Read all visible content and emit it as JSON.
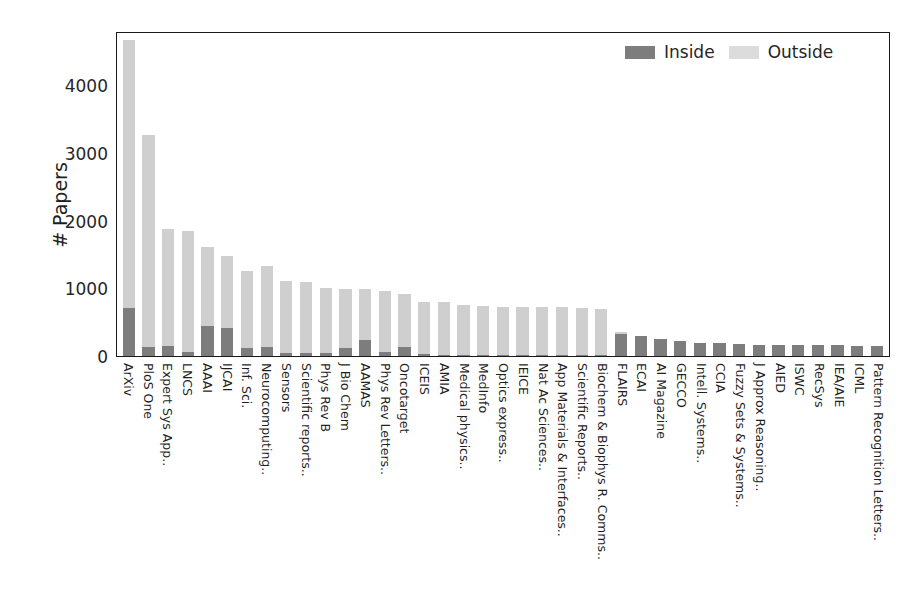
{
  "chart_data": {
    "type": "bar",
    "stacked": true,
    "title": "",
    "xlabel": "",
    "ylabel": "# Papers",
    "ylim": [
      0,
      4800
    ],
    "yticks": [
      0,
      1000,
      2000,
      3000,
      4000
    ],
    "ytick_labels": [
      "0",
      "1000",
      "2000",
      "3000",
      "4000"
    ],
    "grid": false,
    "legend_position": "upper right",
    "categories": [
      "ArXiv",
      "PloS One",
      "Expert Sys App..",
      "LNCS",
      "AAAI",
      "IJCAI",
      "Inf. Sci.",
      "Neurocomputing..",
      "Sensors",
      "Scientific reports..",
      "Phys Rev B",
      "J Bio Chem",
      "AAMAS",
      "Phys Rev Letters..",
      "Oncotarget",
      "ICEIS",
      "AMIA",
      "Medical physics..",
      "MedInfo",
      "Optics express..",
      "IEICE",
      "Nat Ac Sciences..",
      "App Materials & Interfaces..",
      "Scientific Reports..",
      "Biochem & Biophys R. Comms..",
      "FLAIRS",
      "ECAI",
      "AI Magazine",
      "GECCO",
      "Intell. Systems..",
      "CCIA",
      "Fuzzy Sets & Systems..",
      "J Approx Reasoning..",
      "AIED",
      "ISWC",
      "RecSys",
      "IEA/AIE",
      "ICML",
      "Pattern Recognition Letters.."
    ],
    "series": [
      {
        "name": "Inside",
        "color": "#7d7d7d",
        "values": [
          710,
          130,
          150,
          60,
          440,
          410,
          120,
          140,
          40,
          50,
          40,
          120,
          230,
          60,
          140,
          30,
          20,
          20,
          20,
          20,
          20,
          20,
          20,
          20,
          20,
          330,
          290,
          250,
          220,
          195,
          185,
          175,
          170,
          165,
          160,
          160,
          158,
          155,
          152
        ]
      },
      {
        "name": "Outside",
        "color": "#cfcfcf",
        "values": [
          3960,
          3130,
          1730,
          1790,
          1170,
          1070,
          1140,
          1190,
          1070,
          1050,
          970,
          870,
          760,
          900,
          770,
          770,
          780,
          730,
          720,
          710,
          710,
          700,
          700,
          690,
          670,
          20,
          10,
          5,
          5,
          0,
          0,
          0,
          0,
          0,
          0,
          0,
          0,
          0,
          0
        ]
      }
    ],
    "totals": [
      4670,
      3260,
      1880,
      1850,
      1610,
      1480,
      1260,
      1330,
      1110,
      1100,
      1010,
      990,
      990,
      960,
      910,
      800,
      800,
      750,
      740,
      730,
      730,
      720,
      720,
      710,
      690,
      350,
      300,
      255,
      225,
      195,
      185,
      175,
      170,
      165,
      160,
      160,
      158,
      155,
      152
    ]
  },
  "legend": {
    "entries": [
      {
        "label": "Inside",
        "color": "#7d7d7d"
      },
      {
        "label": "Outside",
        "color": "#dcdcdc"
      }
    ]
  },
  "axis": {
    "y_label": "# Papers"
  }
}
